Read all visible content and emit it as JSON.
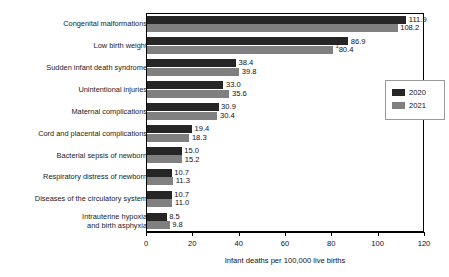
{
  "chart_data": {
    "type": "bar",
    "orientation": "horizontal",
    "title": "",
    "subtitle": "",
    "xlabel": "Infant deaths per 100,000 live births",
    "ylabel": "",
    "xlim": [
      0,
      120
    ],
    "xticks": [
      0,
      20,
      40,
      60,
      80,
      100,
      120
    ],
    "xtick_labels": [
      "0",
      "20",
      "40",
      "60",
      "80",
      "100",
      "120"
    ],
    "grid": false,
    "legend_position": "right",
    "categories": [
      "Congenital malformations",
      "Low birth weight",
      "Sudden infant death syndrome",
      "Unintentional injuries",
      "Maternal complications",
      "Cord and placental complications",
      "Bacterial sepsis of newborn",
      "Respiratory distress of newborn",
      "Diseases of the circulatory system",
      "Intrauterine hypoxia\nand birth asphyxia"
    ],
    "series": [
      {
        "name": "2020",
        "color": "#262626",
        "values": [
          111.9,
          86.9,
          38.4,
          33.0,
          30.9,
          19.4,
          15.0,
          10.7,
          10.7,
          8.5
        ],
        "value_labels": [
          "111.9",
          "86.9",
          "38.4",
          "33.0",
          "30.9",
          "19.4",
          "15.0",
          "10.7",
          "10.7",
          "8.5"
        ],
        "footnotes": [
          "",
          "",
          "",
          "",
          "",
          "",
          "",
          "",
          "",
          ""
        ]
      },
      {
        "name": "2021",
        "color": "#808080",
        "values": [
          108.2,
          80.4,
          39.8,
          35.6,
          30.4,
          18.3,
          15.2,
          11.3,
          11.0,
          9.8
        ],
        "value_labels": [
          "108.2",
          "80.4",
          "39.8",
          "35.6",
          "30.4",
          "18.3",
          "15.2",
          "11.3",
          "11.0",
          "9.8"
        ],
        "footnotes": [
          "",
          "1",
          "",
          "",
          "",
          "",
          "",
          "",
          "",
          ""
        ]
      }
    ],
    "legend": [
      {
        "label": "2020",
        "color": "#262626"
      },
      {
        "label": "2021",
        "color": "#808080"
      }
    ]
  }
}
